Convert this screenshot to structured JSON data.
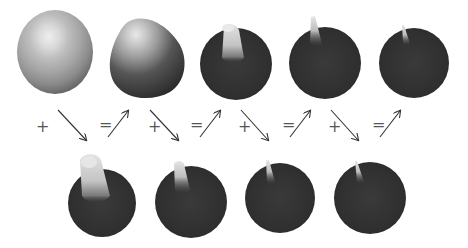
{
  "diagram": {
    "top_row": [
      {
        "id": "shape-1",
        "cx": 55,
        "cy": 52,
        "rx": 38,
        "ry": 42,
        "style": "light-sphere"
      },
      {
        "id": "shape-2",
        "cx": 146,
        "cy": 60,
        "rx": 37,
        "ry": 38,
        "style": "teardrop"
      },
      {
        "id": "shape-3",
        "cx": 236,
        "cy": 64,
        "rx": 36,
        "ry": 36,
        "style": "dark-sphere-wide-spike"
      },
      {
        "id": "shape-4",
        "cx": 325,
        "cy": 63,
        "rx": 36,
        "ry": 36,
        "style": "dark-sphere-medium-spike"
      },
      {
        "id": "shape-5",
        "cx": 414,
        "cy": 63,
        "rx": 35,
        "ry": 36,
        "style": "dark-sphere-thin-spike"
      }
    ],
    "bottom_row": [
      {
        "id": "residual-1",
        "cx": 101,
        "cy": 205,
        "rx": 34,
        "ry": 35,
        "style": "big-spike"
      },
      {
        "id": "residual-2",
        "cx": 190,
        "cy": 202,
        "rx": 36,
        "ry": 36,
        "style": "medium-spike"
      },
      {
        "id": "residual-3",
        "cx": 280,
        "cy": 198,
        "rx": 35,
        "ry": 36,
        "style": "small-spike"
      },
      {
        "id": "residual-4",
        "cx": 369,
        "cy": 198,
        "rx": 36,
        "ry": 36,
        "style": "tiny-spike"
      }
    ],
    "operators": [
      {
        "symbol": "+",
        "x": 36,
        "y": 124,
        "arrow": "down-right",
        "ax1": 58,
        "ay1": 110,
        "ax2": 86,
        "ay2": 141
      },
      {
        "symbol": "=",
        "x": 101,
        "y": 122,
        "arrow": "up-right",
        "ax1": 108,
        "ay1": 137,
        "ax2": 128,
        "ay2": 110
      },
      {
        "symbol": "+",
        "x": 148,
        "y": 124,
        "arrow": "down-right",
        "ax1": 150,
        "ay1": 110,
        "ax2": 178,
        "ay2": 141
      },
      {
        "symbol": "=",
        "x": 191,
        "y": 122,
        "arrow": "up-right",
        "ax1": 200,
        "ay1": 137,
        "ax2": 220,
        "ay2": 110
      },
      {
        "symbol": "+",
        "x": 238,
        "y": 124,
        "arrow": "down-right",
        "ax1": 241,
        "ay1": 110,
        "ax2": 268,
        "ay2": 141
      },
      {
        "symbol": "=",
        "x": 283,
        "y": 122,
        "arrow": "up-right",
        "ax1": 290,
        "ay1": 137,
        "ax2": 310,
        "ay2": 110
      },
      {
        "symbol": "+",
        "x": 328,
        "y": 124,
        "arrow": "down-right",
        "ax1": 331,
        "ay1": 110,
        "ax2": 358,
        "ay2": 141
      },
      {
        "symbol": "=",
        "x": 373,
        "y": 122,
        "arrow": "up-right",
        "ax1": 380,
        "ay1": 137,
        "ax2": 400,
        "ay2": 110
      }
    ],
    "colors": {
      "background": "#ffffff",
      "dark_sphere": "#2e2e2e",
      "light_shape": "#c8c8c8",
      "highlight": "#f0f0f0",
      "arrow": "#333333"
    }
  }
}
